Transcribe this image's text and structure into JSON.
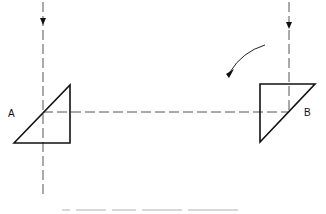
{
  "diagram": {
    "labels": {
      "a": "A",
      "b": "B"
    },
    "colors": {
      "stroke": "#111111",
      "dash": "#555555",
      "caption": "#d8d8d8"
    },
    "prism_a": {
      "points": "14,143 70,85 70,143"
    },
    "prism_b": {
      "points": "260,84 315,84 260,142"
    },
    "rotation_arrow": "curved arrow indicating rotation",
    "caption": ""
  }
}
